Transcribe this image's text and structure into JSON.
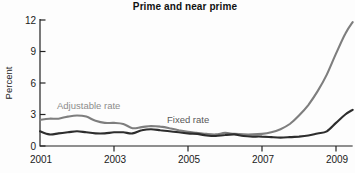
{
  "chart": {
    "title": "Prime and near prime",
    "ylabel": "Percent",
    "series_labels": {
      "adjustable": "Adjustable rate",
      "fixed": "Fixed rate"
    }
  },
  "chart_data": {
    "type": "line",
    "title": "Prime and near prime",
    "xlabel": "",
    "ylabel": "Percent",
    "xlim": [
      2001,
      2009.45
    ],
    "ylim": [
      0,
      12
    ],
    "yticks": [
      0,
      3,
      6,
      9,
      12
    ],
    "xticks": [
      2001,
      2003,
      2005,
      2007,
      2009
    ],
    "grid": false,
    "legend_position": "inline-annotations",
    "x": [
      2001,
      2001.25,
      2001.5,
      2001.75,
      2002,
      2002.25,
      2002.5,
      2002.75,
      2003,
      2003.25,
      2003.5,
      2003.75,
      2004,
      2004.25,
      2004.5,
      2004.75,
      2005,
      2005.25,
      2005.5,
      2005.75,
      2006,
      2006.25,
      2006.5,
      2006.75,
      2007,
      2007.25,
      2007.5,
      2007.75,
      2008,
      2008.25,
      2008.5,
      2008.75,
      2009,
      2009.25,
      2009.45
    ],
    "series": [
      {
        "name": "Adjustable rate",
        "color": "#7e7e7e",
        "values": [
          2.5,
          2.6,
          2.6,
          2.8,
          2.9,
          2.8,
          2.4,
          2.2,
          2.2,
          2.1,
          1.7,
          1.8,
          1.9,
          1.85,
          1.7,
          1.5,
          1.35,
          1.25,
          1.15,
          1.1,
          1.25,
          1.15,
          1.1,
          1.1,
          1.15,
          1.3,
          1.6,
          2.1,
          2.9,
          3.9,
          5.2,
          6.8,
          8.8,
          10.7,
          11.8
        ]
      },
      {
        "name": "Fixed rate",
        "color": "#2d2d2d",
        "values": [
          1.4,
          1.1,
          1.2,
          1.3,
          1.4,
          1.3,
          1.2,
          1.2,
          1.3,
          1.3,
          1.2,
          1.5,
          1.6,
          1.5,
          1.4,
          1.3,
          1.2,
          1.15,
          1.0,
          0.95,
          1.05,
          1.1,
          0.95,
          0.9,
          0.9,
          0.85,
          0.8,
          0.85,
          0.9,
          1.0,
          1.2,
          1.4,
          2.2,
          3.0,
          3.45
        ]
      }
    ]
  },
  "colors": {
    "background": "#fdfdfd",
    "axis": "#222222",
    "tick_label": "#1a1a1a",
    "title": "#111111",
    "adjustable_line": "#7e7e7e",
    "fixed_line": "#2d2d2d",
    "adjustable_label": "#8c8c8c",
    "fixed_label": "#595959"
  }
}
